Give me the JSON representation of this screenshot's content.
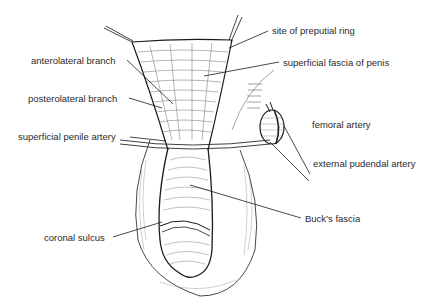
{
  "figure": {
    "type": "anatomical illustration"
  },
  "labels": [
    {
      "id": "site-of-preputial-ring",
      "text": "site of preputial ring",
      "x": 272,
      "y": 26
    },
    {
      "id": "superficial-fascia-of-penis",
      "text": "superficial fascia of penis",
      "x": 283,
      "y": 57
    },
    {
      "id": "anterolateral-branch",
      "text": "anterolateral branch",
      "x": 31,
      "y": 55
    },
    {
      "id": "posterolateral-branch",
      "text": "posterolateral branch",
      "x": 28,
      "y": 93
    },
    {
      "id": "superficial-penile-artery",
      "text": "superficial penile artery",
      "x": 18,
      "y": 131
    },
    {
      "id": "femoral-artery",
      "text": "femoral artery",
      "x": 312,
      "y": 173
    },
    {
      "id": "external-pudendal-artery",
      "text": "external pudendal artery",
      "x": 313,
      "y": 180
    },
    {
      "id": "bucks-fascia",
      "text": "Buck’s fascia",
      "x": 305,
      "y": 213
    },
    {
      "id": "coronal-sulcus",
      "text": "coronal sulcus",
      "x": 44,
      "y": 232
    }
  ],
  "colors": {
    "line": "#1a1a1a",
    "hatch": "#555555",
    "text": "#2a2a2a",
    "background": "#ffffff"
  }
}
